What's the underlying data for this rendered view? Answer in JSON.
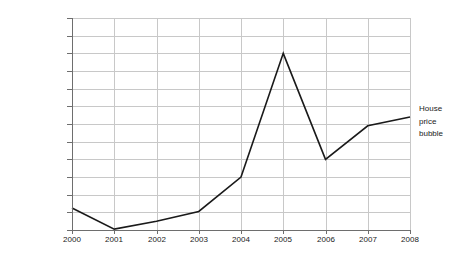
{
  "chart_data": {
    "type": "line",
    "title": "",
    "xlabel": "",
    "ylabel": "",
    "categories": [
      "2000",
      "2001",
      "2002",
      "2003",
      "2004",
      "2005",
      "2006",
      "2007",
      "2008"
    ],
    "series": [
      {
        "name": "House price bubble",
        "values": [
          2.5e-08,
          1e-09,
          1e-08,
          2.1e-08,
          6e-08,
          2e-07,
          8e-08,
          1.18e-07,
          1.28e-07
        ]
      }
    ],
    "y_tick_labels": [
      "0.000000240%",
      "0.000000220%",
      "0.000000200%",
      "0.000000180%",
      "0.000000160%",
      "0.000000130%",
      "0.000000120%",
      "0.000000100%",
      "0.000000080%",
      "0.000000060%",
      "0.000000040%",
      "0.000000020%",
      "0.000000000%"
    ],
    "y_tick_values": [
      2.4e-07,
      2.2e-07,
      2e-07,
      1.8e-07,
      1.6e-07,
      1.3e-07,
      1.2e-07,
      1e-07,
      8e-08,
      6e-08,
      4e-08,
      2e-08,
      0.0
    ],
    "x_tick_labels": [
      "2000",
      "2001",
      "2002",
      "2003",
      "2004",
      "2005",
      "2006",
      "2007",
      "2008"
    ],
    "ylim": [
      0.0,
      2.4e-07
    ],
    "grid": "both",
    "legend_position": "right-outside",
    "series_color": "#1a1a1a",
    "grid_color": "#c8c8c8",
    "axis_color": "#6e6e6e"
  },
  "legend": {
    "label": "House\nprice\nbubble"
  }
}
